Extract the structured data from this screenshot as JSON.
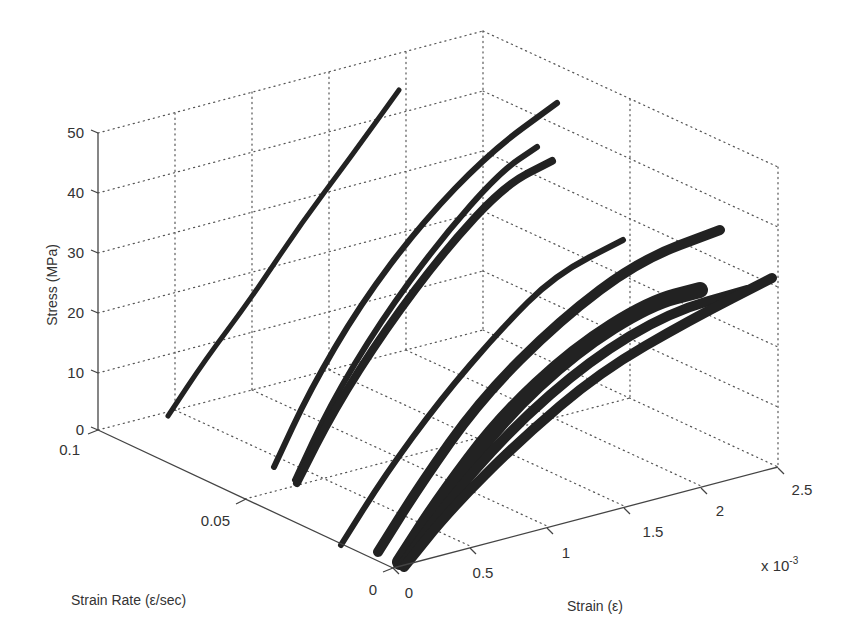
{
  "chart_data": {
    "type": "line3d",
    "title": "",
    "xlabel": "Strain (ε)",
    "ylabel": "Strain Rate (ε/sec)",
    "zlabel": "Stress (MPa)",
    "x_multiplier_label": "x 10",
    "x_multiplier_exponent": "-3",
    "xlim": [
      0,
      0.0025
    ],
    "ylim": [
      0,
      0.1
    ],
    "zlim": [
      0,
      50
    ],
    "x_ticks": [
      "0",
      "0.5",
      "1",
      "1.5",
      "2",
      "2.5"
    ],
    "y_ticks": [
      "0",
      "0.05",
      "0.1"
    ],
    "z_ticks": [
      "0",
      "10",
      "20",
      "30",
      "40",
      "50"
    ],
    "grid": true,
    "legend": null,
    "series": [
      {
        "name": "rate ≈ 0.09",
        "strain_rate": 0.09,
        "width": 5,
        "points": [
          [
            0.0,
            0
          ],
          [
            0.0005,
            14
          ],
          [
            0.001,
            26
          ],
          [
            0.0015,
            36
          ],
          [
            0.0019,
            43
          ]
        ],
        "screen": [
          [
            168,
            416
          ],
          [
            205,
            360
          ],
          [
            250,
            300
          ],
          [
            300,
            225
          ],
          [
            350,
            158
          ],
          [
            399,
            90
          ]
        ]
      },
      {
        "name": "rate ≈ 0.06 (a)",
        "strain_rate": 0.06,
        "width": 6,
        "points": [
          [
            0.0,
            0
          ],
          [
            0.0005,
            13
          ],
          [
            0.001,
            25
          ],
          [
            0.0015,
            34
          ],
          [
            0.0021,
            42
          ]
        ],
        "screen": [
          [
            274,
            467
          ],
          [
            310,
            390
          ],
          [
            360,
            305
          ],
          [
            420,
            225
          ],
          [
            490,
            152
          ],
          [
            557,
            103
          ]
        ]
      },
      {
        "name": "rate ≈ 0.06 (b)",
        "strain_rate": 0.058,
        "width": 6,
        "points": [
          [
            0.0,
            0
          ],
          [
            0.0005,
            12
          ],
          [
            0.001,
            23
          ],
          [
            0.0015,
            32
          ],
          [
            0.002,
            39
          ]
        ],
        "screen": [
          [
            295,
            480
          ],
          [
            330,
            405
          ],
          [
            380,
            322
          ],
          [
            440,
            240
          ],
          [
            500,
            172
          ],
          [
            537,
            147
          ]
        ]
      },
      {
        "name": "rate ≈ 0.06 (c)",
        "strain_rate": 0.056,
        "width": 8,
        "points": [
          [
            0.0,
            0
          ],
          [
            0.0005,
            11
          ],
          [
            0.001,
            22
          ],
          [
            0.0015,
            31
          ],
          [
            0.0021,
            38
          ]
        ],
        "screen": [
          [
            297,
            483
          ],
          [
            334,
            410
          ],
          [
            385,
            330
          ],
          [
            445,
            250
          ],
          [
            505,
            185
          ],
          [
            552,
            161
          ]
        ]
      },
      {
        "name": "rate ≈ 0.02",
        "strain_rate": 0.02,
        "width": 6,
        "points": [
          [
            0.0,
            0
          ],
          [
            0.0005,
            11
          ],
          [
            0.001,
            21
          ],
          [
            0.0015,
            30
          ],
          [
            0.0019,
            35
          ]
        ],
        "screen": [
          [
            341,
            545
          ],
          [
            385,
            475
          ],
          [
            440,
            400
          ],
          [
            500,
            330
          ],
          [
            555,
            275
          ],
          [
            623,
            240
          ]
        ]
      },
      {
        "name": "rate ≈ 0.01",
        "strain_rate": 0.01,
        "width": 10,
        "points": [
          [
            0.0,
            0
          ],
          [
            0.0005,
            10
          ],
          [
            0.001,
            19
          ],
          [
            0.0015,
            27
          ],
          [
            0.0022,
            35
          ]
        ],
        "screen": [
          [
            378,
            552
          ],
          [
            420,
            485
          ],
          [
            480,
            400
          ],
          [
            560,
            320
          ],
          [
            640,
            260
          ],
          [
            720,
            230
          ]
        ]
      },
      {
        "name": "rate ≈ 0.005 (a)",
        "strain_rate": 0.005,
        "width": 16,
        "points": [
          [
            0.0,
            0
          ],
          [
            0.0005,
            9
          ],
          [
            0.001,
            17
          ],
          [
            0.0015,
            24
          ],
          [
            0.0023,
            30
          ]
        ],
        "screen": [
          [
            400,
            562
          ],
          [
            440,
            500
          ],
          [
            500,
            420
          ],
          [
            575,
            350
          ],
          [
            650,
            303
          ],
          [
            700,
            290
          ]
        ]
      },
      {
        "name": "rate ≈ 0.005 (b)",
        "strain_rate": 0.004,
        "width": 10,
        "points": [
          [
            0.0,
            0
          ],
          [
            0.0005,
            8
          ],
          [
            0.001,
            16
          ],
          [
            0.0015,
            23
          ],
          [
            0.0024,
            28
          ]
        ],
        "screen": [
          [
            402,
            565
          ],
          [
            445,
            505
          ],
          [
            510,
            430
          ],
          [
            590,
            360
          ],
          [
            670,
            312
          ],
          [
            747,
            290
          ]
        ]
      },
      {
        "name": "rate ≈ 0.003",
        "strain_rate": 0.003,
        "width": 10,
        "points": [
          [
            0.0,
            0
          ],
          [
            0.0005,
            8
          ],
          [
            0.001,
            15
          ],
          [
            0.0015,
            21
          ],
          [
            0.0025,
            27
          ]
        ],
        "screen": [
          [
            404,
            567
          ],
          [
            450,
            510
          ],
          [
            520,
            440
          ],
          [
            600,
            372
          ],
          [
            690,
            320
          ],
          [
            772,
            278
          ]
        ]
      }
    ]
  },
  "caption": {
    "text": ""
  }
}
